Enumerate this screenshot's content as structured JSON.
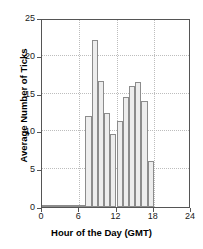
{
  "chart_data": {
    "type": "bar",
    "title": "",
    "xlabel": "Hour of the Day (GMT)",
    "ylabel": "Average Number of Ticks",
    "xlim": [
      0,
      24
    ],
    "ylim": [
      0,
      25
    ],
    "xticks": [
      0,
      6,
      12,
      18,
      24
    ],
    "yticks": [
      0,
      5,
      10,
      15,
      20,
      25
    ],
    "xtick_labels": [
      "0",
      "6",
      "12",
      "18",
      "24"
    ],
    "ytick_labels": [
      "0",
      "5",
      "10",
      "15",
      "20",
      "25"
    ],
    "grid": true,
    "legend": null,
    "bin_width": 1,
    "bar_color": "#ededed",
    "bar_edge_color": "#8c8c8c",
    "grid_color": "#bdbdbd",
    "axis_color": "#555555",
    "categories": [
      "0-1",
      "1-2",
      "2-3",
      "3-4",
      "4-5",
      "5-6",
      "6-7",
      "7-8",
      "8-9",
      "9-10",
      "10-11",
      "11-12",
      "12-13",
      "13-14",
      "14-15",
      "15-16",
      "16-17",
      "17-18"
    ],
    "x": [
      0,
      1,
      2,
      3,
      4,
      5,
      6,
      7,
      8,
      9,
      10,
      11,
      12,
      13,
      14,
      15,
      16,
      17
    ],
    "values": [
      0.15,
      0.2,
      0.25,
      0.2,
      0.2,
      0.2,
      0.25,
      12.0,
      22.1,
      16.7,
      12.5,
      9.7,
      11.4,
      14.6,
      16.0,
      16.6,
      14.0,
      6.1
    ]
  }
}
